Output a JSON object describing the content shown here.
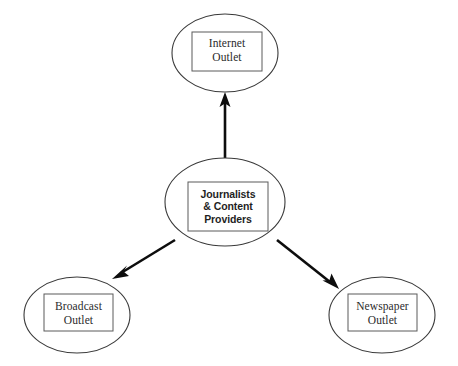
{
  "diagram": {
    "type": "hub-and-spoke",
    "background_color": "#ffffff",
    "line_color": "#0d0d0d",
    "ellipse_stroke_color": "#3a3a3a",
    "box_stroke_color": "#5a5a5a",
    "text_color": "#2b2b2b",
    "nodes": [
      {
        "id": "internet-outlet",
        "label": "Internet\nOutlet",
        "role": "destination",
        "font_style": "serif",
        "ellipse": {
          "cx": 225,
          "cy": 53,
          "rx": 53,
          "ry": 39
        },
        "box": {
          "x": 192,
          "y": 32,
          "width": 70,
          "height": 39
        }
      },
      {
        "id": "journalists-content-providers",
        "label": "Journalists\n& Content\nProviders",
        "role": "source",
        "font_style": "sans",
        "ellipse": {
          "cx": 225,
          "cy": 202,
          "rx": 60,
          "ry": 44
        },
        "box": {
          "x": 188,
          "y": 182,
          "width": 80,
          "height": 49
        }
      },
      {
        "id": "broadcast-outlet",
        "label": "Broadcast\nOutlet",
        "role": "destination",
        "font_style": "serif",
        "ellipse": {
          "cx": 77,
          "cy": 315,
          "rx": 53,
          "ry": 38
        },
        "box": {
          "x": 44,
          "y": 294,
          "width": 69,
          "height": 37
        }
      },
      {
        "id": "newspaper-outlet",
        "label": "Newspaper\nOutlet",
        "role": "destination",
        "font_style": "serif",
        "ellipse": {
          "cx": 382,
          "cy": 315,
          "rx": 53,
          "ry": 38
        },
        "box": {
          "x": 348,
          "y": 294,
          "width": 69,
          "height": 37
        }
      }
    ],
    "edges": [
      {
        "id": "edge-to-internet",
        "from": "journalists-content-providers",
        "to": "internet-outlet",
        "direction": "up",
        "arrowhead": "end",
        "x1": 225,
        "y1": 158,
        "x2": 225,
        "y2": 94
      },
      {
        "id": "edge-to-broadcast",
        "from": "journalists-content-providers",
        "to": "broadcast-outlet",
        "direction": "down-left",
        "arrowhead": "end",
        "x1": 175,
        "y1": 240,
        "x2": 114,
        "y2": 278
      },
      {
        "id": "edge-to-newspaper",
        "from": "journalists-content-providers",
        "to": "newspaper-outlet",
        "direction": "down-right",
        "arrowhead": "end",
        "x1": 277,
        "y1": 240,
        "x2": 337,
        "y2": 288
      }
    ]
  }
}
